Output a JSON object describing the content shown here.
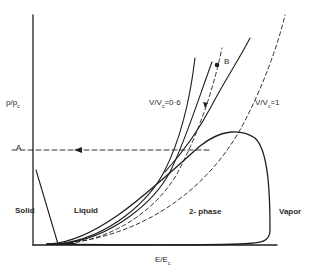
{
  "figure": {
    "y_axis_label": "p/p",
    "y_axis_sub": "c",
    "x_axis_label": "E/E",
    "x_axis_sub": "c",
    "point_A": "A",
    "point_B": "B",
    "curve_labels": {
      "v06": "V/V",
      "v06_sub": "c",
      "v06_val": "=0·6",
      "v1": "V/V",
      "v1_sub": "c",
      "v1_val": "=1"
    },
    "regions": {
      "solid": "Solid",
      "liquid": "Liquid",
      "two_phase": "2- phase",
      "vapor": "Vapor"
    },
    "colors": {
      "line": "#1e1e1e",
      "background": "#ffffff"
    }
  }
}
